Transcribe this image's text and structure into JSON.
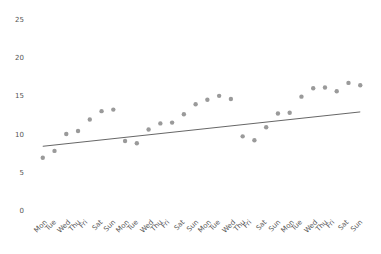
{
  "chart_data": {
    "type": "scatter",
    "title": "",
    "subtitle": "",
    "xlabel": "",
    "ylabel": "",
    "xlim": [
      0,
      29
    ],
    "ylim": [
      0,
      25
    ],
    "grid": false,
    "legend": null,
    "y_ticks": [
      0,
      5,
      10,
      15,
      20,
      25
    ],
    "y_tick_labels": [
      "0",
      "5",
      "10",
      "15",
      "20",
      "25"
    ],
    "x_tick_labels": [
      "Mon",
      "Tue",
      "Wed",
      "Thu",
      "Fri",
      "Sat",
      "Sun",
      "Mon",
      "Tue",
      "Wed",
      "Thu",
      "Fri",
      "Sat",
      "Sun",
      "Mon",
      "Tue",
      "Wed",
      "Thu",
      "Fri",
      "Sat",
      "Sun",
      "Mon",
      "Tue",
      "Wed",
      "Thu",
      "Fri",
      "Sat",
      "Sun"
    ],
    "x": [
      1,
      2,
      3,
      4,
      5,
      6,
      7,
      8,
      9,
      10,
      11,
      12,
      13,
      14,
      15,
      16,
      17,
      18,
      19,
      20,
      21,
      22,
      23,
      24,
      25,
      26,
      27,
      28
    ],
    "values": [
      7.1,
      8.0,
      10.2,
      10.6,
      12.1,
      13.2,
      13.4,
      9.3,
      9.0,
      10.8,
      11.6,
      11.7,
      12.8,
      14.1,
      14.7,
      15.2,
      14.8,
      9.9,
      9.4,
      11.1,
      12.9,
      13.0,
      15.1,
      16.2,
      16.3,
      15.8,
      16.9,
      16.6
    ],
    "marker_color": "#9a9a9a",
    "marker_size": 2.2,
    "series": [
      {
        "name": "observations",
        "type": "scatter",
        "values": [
          7.1,
          8.0,
          10.2,
          10.6,
          12.1,
          13.2,
          13.4,
          9.3,
          9.0,
          10.8,
          11.6,
          11.7,
          12.8,
          14.1,
          14.7,
          15.2,
          14.8,
          9.9,
          9.4,
          11.1,
          12.9,
          13.0,
          15.1,
          16.2,
          16.3,
          15.8,
          16.9,
          16.6
        ]
      },
      {
        "name": "trend-line",
        "type": "line",
        "color": "#555555",
        "x_start": 1,
        "x_end": 28,
        "y_start": 8.6,
        "y_end": 13.1
      }
    ]
  },
  "axes": {
    "y_axis_name": "y-axis",
    "x_axis_name": "x-axis"
  }
}
